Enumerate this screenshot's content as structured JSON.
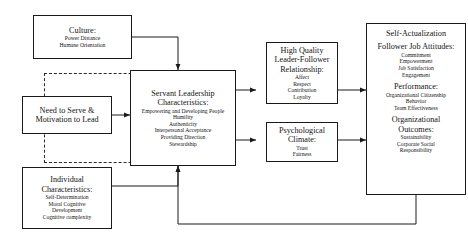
{
  "diagram": {
    "title_present": false,
    "colors": {
      "line": "#1a1a1a",
      "dashed_boundary": "#2a2a2a",
      "background": "#ffffff",
      "text": "#141414"
    },
    "nodes": {
      "culture": {
        "heading": "Culture:",
        "items": [
          "Power Distance",
          "Humane Orientation"
        ]
      },
      "need_to_serve": {
        "heading_line1": "Need to Serve &",
        "heading_line2": "Motivation to Lead",
        "items": []
      },
      "individual_characteristics": {
        "heading_line1": "Individual",
        "heading_line2": "Characteristics:",
        "items": [
          "Self-Determination",
          "Moral Cognitive",
          "Development",
          "Cognitive complexity"
        ]
      },
      "servant_leadership": {
        "heading_line1": "Servant Leadership",
        "heading_line2": "Characteristics:",
        "items": [
          "Empowering and Developing People",
          "Humility",
          "Authenticity",
          "Interpersonal Acceptance",
          "Providing Direction",
          "Stewardship"
        ]
      },
      "lmx": {
        "heading_line1": "High Quality",
        "heading_line2": "Leader-Follower",
        "heading_line3": "Relationship:",
        "items": [
          "Affect",
          "Respect",
          "Contribution",
          "Loyalty"
        ]
      },
      "psychological_climate": {
        "heading_line1": "Psychological",
        "heading_line2": "Climate:",
        "items": [
          "Trust",
          "Fairness"
        ]
      },
      "outcomes": {
        "title": "Self-Actualization",
        "sections": [
          {
            "heading": "Follower Job Attitudes:",
            "items": [
              "Commitment",
              "Empowerment",
              "Job Satisfaction",
              "Engagement"
            ]
          },
          {
            "heading": "Performance:",
            "items": [
              "Organizational Citizenship",
              "Behavior",
              "Team Effectiveness"
            ]
          },
          {
            "heading_line1": "Organizational",
            "heading_line2": "Outcomes:",
            "items": [
              "Sustainability",
              "Corporate Social",
              "Responsibility"
            ]
          }
        ]
      }
    },
    "connections": [
      {
        "from": "culture",
        "to": "servant_leadership",
        "style": "solid-arrow"
      },
      {
        "from": "need_to_serve",
        "to": "servant_leadership",
        "style": "solid-arrow"
      },
      {
        "from": "individual_characteristics",
        "to": "servant_leadership",
        "style": "solid-arrow"
      },
      {
        "from": "servant_leadership",
        "to": "lmx",
        "style": "solid-arrow"
      },
      {
        "from": "servant_leadership",
        "to": "psychological_climate",
        "style": "solid-arrow"
      },
      {
        "from": "lmx",
        "to": "outcomes",
        "style": "solid-arrow"
      },
      {
        "from": "psychological_climate",
        "to": "outcomes",
        "style": "solid-arrow"
      },
      {
        "from": "outcomes",
        "to": "servant_leadership",
        "style": "solid-arrow-feedback"
      }
    ]
  }
}
